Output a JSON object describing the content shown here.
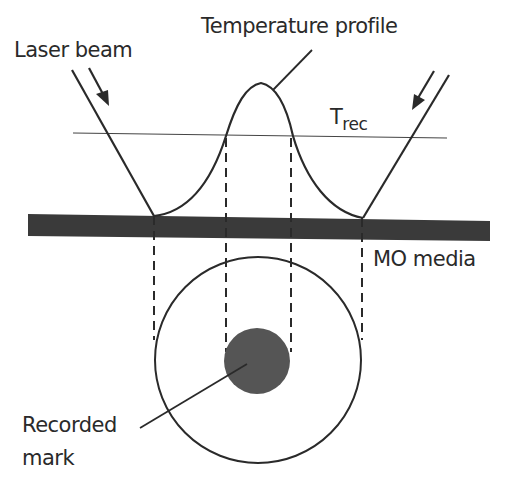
{
  "diagram": {
    "labels": {
      "laser_beam": "Laser beam",
      "temperature_profile": "Temperature profile",
      "trec_main": "T",
      "trec_sub": "rec",
      "mo_media": "MO media",
      "recorded_mark_line1": "Recorded",
      "recorded_mark_line2": "mark"
    },
    "colors": {
      "line": "#2a2a2a",
      "media": "#3a3a3a",
      "mark": "#555555",
      "background": "#ffffff"
    }
  }
}
